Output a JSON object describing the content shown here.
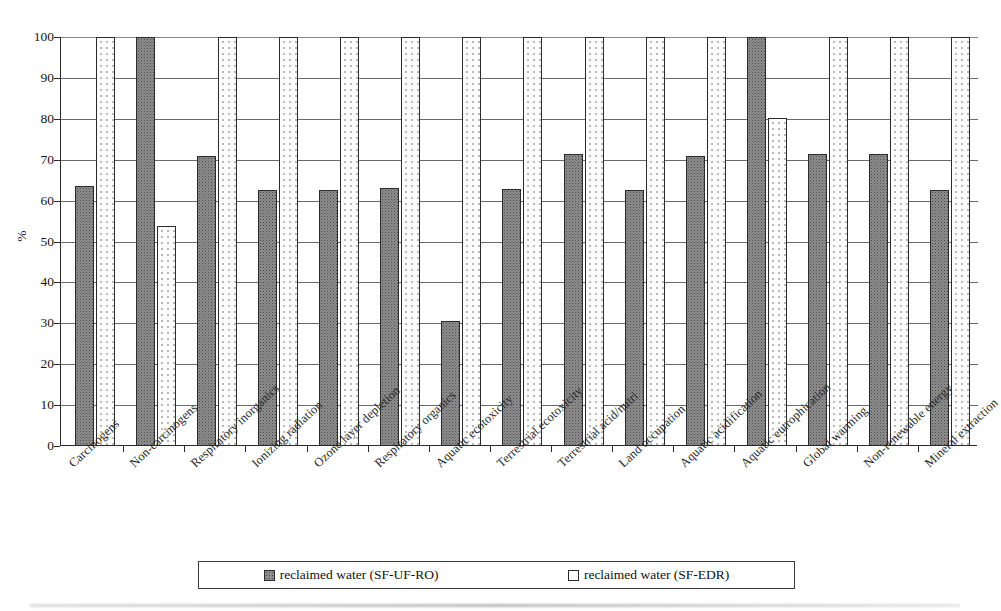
{
  "chart_data": {
    "type": "bar",
    "title": "",
    "xlabel": "",
    "ylabel": "%",
    "ylim": [
      0,
      100
    ],
    "yticks": [
      0,
      10,
      20,
      30,
      40,
      50,
      60,
      70,
      80,
      90,
      100
    ],
    "grid": true,
    "legend_position": "bottom",
    "categories": [
      "Carcinogens",
      "Non-carcinogens",
      "Respiratory inorganics",
      "Ionizing radiation",
      "Ozone layer depletion",
      "Respiratory organics",
      "Aquatic ecotoxicity",
      "Terrestrial ecotoxicity",
      "Terrestrial acid/nutri",
      "Land occupation",
      "Aquatic acidification",
      "Aquatic eutrophication",
      "Global warming",
      "Non-renewable energy",
      "Mineral extraction"
    ],
    "series": [
      {
        "name": "reclaimed water (SF-UF-RO)",
        "pattern": "dark-stipple",
        "color": "#8e8e8e",
        "values": [
          63.5,
          100,
          70.8,
          62.5,
          62.5,
          63.0,
          30.5,
          62.8,
          71.4,
          62.5,
          70.9,
          100,
          71.5,
          71.4,
          62.5
        ]
      },
      {
        "name": "reclaimed water (SF-EDR)",
        "pattern": "light-dots",
        "color": "#ffffff",
        "values": [
          100,
          53.8,
          100,
          100,
          100,
          100,
          100,
          100,
          100,
          100,
          100,
          80.3,
          100,
          100,
          100
        ]
      }
    ]
  },
  "legend": {
    "items": [
      {
        "label": "reclaimed water (SF-UF-RO)",
        "swatch": "dark"
      },
      {
        "label": "reclaimed water (SF-EDR)",
        "swatch": "light"
      }
    ]
  }
}
